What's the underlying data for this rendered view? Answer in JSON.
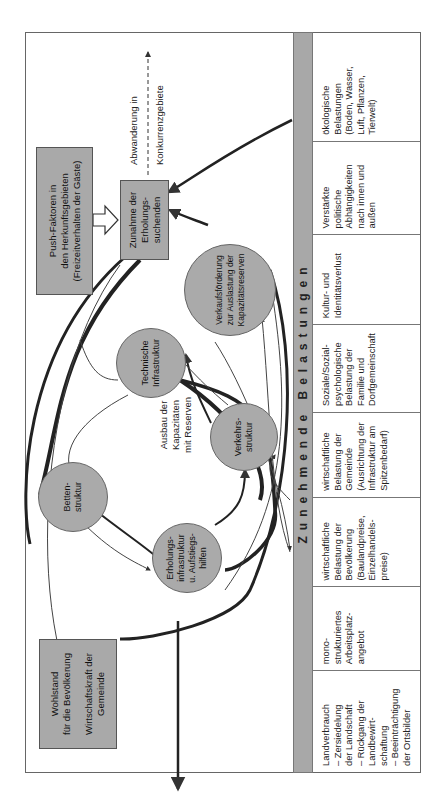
{
  "diagram": {
    "banner": "Zunehmende Belastungen",
    "boxes": {
      "push_factors": [
        "Push-Faktoren in",
        "den Herkunftsgebieten",
        "(Freizeitverhalten der Gäste)"
      ],
      "increase": [
        "Zunahme der",
        "Erholungs-",
        "suchenden"
      ],
      "prosperity": [
        "Wohlstand",
        "für die Bevölkerung",
        "Wirtschaftskraft der",
        "Gemeinde"
      ]
    },
    "circles": {
      "beds": "Betten-\nstruktur",
      "technical": "Technische\nInfrastruktur",
      "traffic": "Verkehrs-\nstruktur",
      "recreation": "Erholungs-\ninfrastruktur\nu. Aufstiegs-\nhilfen",
      "sales": "Verkaufsförderung\nzur Auslastung der\nKapazitätsreserven"
    },
    "labels": {
      "expansion": "Ausbau der\nKapazitäten\nmit Reserven",
      "migration_1": "Abwanderung in",
      "migration_2": "Konkurrenzgebiete"
    },
    "burdens": [
      "Landverbrauch\n– Zersiedelung\n   der Landschaft\n– Rückgang der\n   Landbewirt-\n   schaftung\n– Beeinträchtigung\n   der Ortsbilder",
      "mono-\nstrukturiertes\nArbeitsplatz-\nangebot",
      "wirtschaftliche\nBelastung der\nBevölkerung\n(Baulandpreise,\nEinzelhandels-\npreise)",
      "wirtschaftliche\nBelastung der\nGemeinde\n(Ausrichtung der\nInfrastruktur am\nSpitzenbedarf)",
      "Soziale/Sozial-\npsychologische\nBelastung der\nFamilie und\nDorfgemeinschaft",
      "Kultur- und\nIdentitätsverlust",
      "Verstärkte\npolitische\nAbhängigkeiten\nnach innen und\naußen",
      "ökologische\nBelastungen\n(Boden, Wasser,\nLuft, Pflanzen,\nTierwelt)"
    ]
  }
}
